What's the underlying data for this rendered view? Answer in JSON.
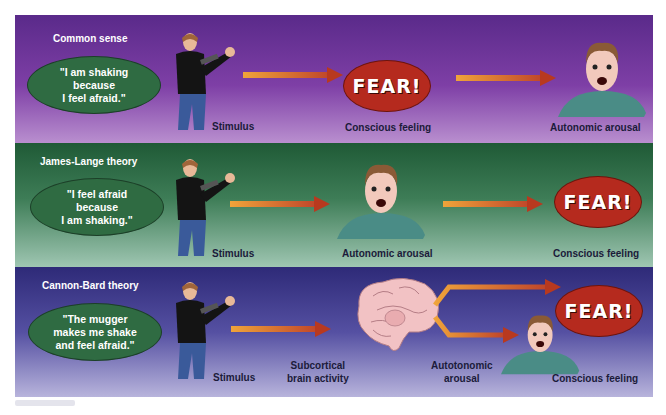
{
  "panels": [
    {
      "title": "Common sense",
      "quote": "\"I am shaking\nbecause\nI feel afraid.\"",
      "labels": {
        "stimulus": "Stimulus",
        "middle": "Conscious feeling",
        "right": "Autonomic arousal"
      },
      "middle_icon": "fear-bubble",
      "right_icon": "frightened-face"
    },
    {
      "title": "James-Lange theory",
      "quote": "\"I feel afraid\nbecause\nI am shaking.\"",
      "labels": {
        "stimulus": "Stimulus",
        "middle": "Autonomic arousal",
        "right": "Conscious feeling"
      },
      "middle_icon": "frightened-face",
      "right_icon": "fear-bubble"
    },
    {
      "title": "Cannon-Bard theory",
      "quote": "\"The mugger\nmakes me shake\nand feel afraid.\"",
      "labels": {
        "stimulus": "Stimulus",
        "middle": "Subcortical\nbrain activity",
        "branch_lower": "Autotonomic\narousal",
        "right": "Conscious feeling"
      },
      "middle_icon": "brain",
      "right_icon": "fear-bubble"
    }
  ],
  "fear_text": "FEAR!",
  "colors": {
    "purple_panel": "#7e3fa6",
    "green_panel": "#3e7d57",
    "blue_panel": "#5550a2",
    "quote_ellipse": "#2f6b42",
    "fear_ellipse": "#b52a1e",
    "arrow_start": "#f0a43a",
    "arrow_end": "#c0462a"
  }
}
